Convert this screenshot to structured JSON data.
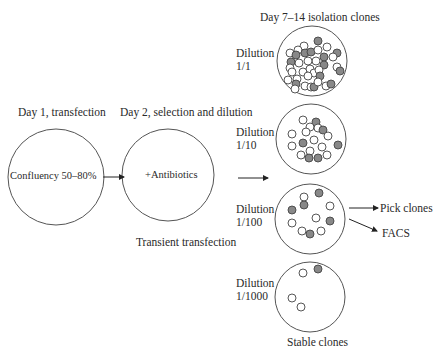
{
  "labels": {
    "day1": "Day 1, transfection",
    "day2": "Day 2, selection and dilution",
    "day7": "Day 7–14 isolation clones",
    "transient": "Transient transfection",
    "stable": "Stable clones",
    "pick": "Pick clones",
    "facs": "FACS"
  },
  "stage_circles": [
    {
      "label": "Confluency 50–80%"
    },
    {
      "label": "+Antibiotics"
    }
  ],
  "dilutions": [
    {
      "title": "Dilution",
      "ratio": "1/1"
    },
    {
      "title": "Dilution",
      "ratio": "1/10"
    },
    {
      "title": "Dilution",
      "ratio": "1/100"
    },
    {
      "title": "Dilution",
      "ratio": "1/1000"
    }
  ],
  "colors": {
    "outline": "#555555",
    "filled_clone": "#8a8a8a",
    "empty_clone": "#ffffff"
  }
}
